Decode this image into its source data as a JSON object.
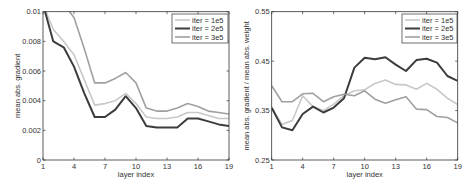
{
  "chart_data": [
    {
      "type": "line",
      "title": "",
      "xlabel": "layer index",
      "ylabel": "mean abs. gradient",
      "xlim": [
        1,
        19
      ],
      "ylim": [
        0,
        0.01
      ],
      "xticks": [
        "1",
        "4",
        "7",
        "10",
        "13",
        "16",
        "19"
      ],
      "yticks": [
        "0",
        "0.002",
        "0.004",
        "0.006",
        "0.008",
        "0.01"
      ],
      "grid": false,
      "legend_position": "upper right",
      "x": [
        1,
        2,
        3,
        4,
        5,
        6,
        7,
        8,
        9,
        10,
        11,
        12,
        13,
        14,
        15,
        16,
        17,
        18,
        19
      ],
      "series": [
        {
          "name": "iter = 1e5",
          "color": "#c8c8c8",
          "width": 1.6,
          "values": [
            0.0105,
            0.0088,
            0.008,
            0.0071,
            0.0054,
            0.0037,
            0.0038,
            0.004,
            0.0045,
            0.0038,
            0.0029,
            0.0028,
            0.0028,
            0.0029,
            0.0032,
            0.0032,
            0.003,
            0.0028,
            0.0028
          ]
        },
        {
          "name": "iter = 2e5",
          "color": "#3c3c3c",
          "width": 2.0,
          "values": [
            0.0105,
            0.008,
            0.0076,
            0.0063,
            0.0045,
            0.0029,
            0.0029,
            0.0034,
            0.0043,
            0.0035,
            0.0023,
            0.0022,
            0.0022,
            0.0022,
            0.0028,
            0.0028,
            0.0026,
            0.0024,
            0.0023
          ]
        },
        {
          "name": "iter = 3e5",
          "color": "#a0a0a0",
          "width": 1.6,
          "values": [
            0.0105,
            0.0105,
            0.0105,
            0.0096,
            0.0075,
            0.0052,
            0.0052,
            0.0055,
            0.0059,
            0.0052,
            0.0035,
            0.0033,
            0.0033,
            0.0035,
            0.0038,
            0.0036,
            0.0033,
            0.0032,
            0.0031
          ]
        }
      ]
    },
    {
      "type": "line",
      "title": "",
      "xlabel": "layer index",
      "ylabel": "mean abs. gradient / mean abs. weight",
      "xlim": [
        1,
        19
      ],
      "ylim": [
        0.25,
        0.55
      ],
      "xticks": [
        "1",
        "4",
        "7",
        "10",
        "13",
        "16",
        "19"
      ],
      "yticks": [
        "0.25",
        "0.35",
        "0.45",
        "0.55"
      ],
      "grid": false,
      "legend_position": "upper right",
      "x": [
        1,
        2,
        3,
        4,
        5,
        6,
        7,
        8,
        9,
        10,
        11,
        12,
        13,
        14,
        15,
        16,
        17,
        18,
        19
      ],
      "series": [
        {
          "name": "iter = 1e5",
          "color": "#c8c8c8",
          "width": 1.6,
          "values": [
            0.356,
            0.322,
            0.33,
            0.38,
            0.358,
            0.35,
            0.363,
            0.38,
            0.39,
            0.392,
            0.405,
            0.412,
            0.403,
            0.402,
            0.393,
            0.405,
            0.393,
            0.375,
            0.362
          ]
        },
        {
          "name": "iter = 2e5",
          "color": "#3c3c3c",
          "width": 2.0,
          "values": [
            0.356,
            0.316,
            0.31,
            0.343,
            0.358,
            0.346,
            0.356,
            0.375,
            0.437,
            0.457,
            0.454,
            0.458,
            0.443,
            0.43,
            0.452,
            0.455,
            0.447,
            0.42,
            0.41
          ]
        },
        {
          "name": "iter = 3e5",
          "color": "#a0a0a0",
          "width": 1.6,
          "values": [
            0.4,
            0.368,
            0.368,
            0.384,
            0.385,
            0.368,
            0.378,
            0.383,
            0.38,
            0.39,
            0.373,
            0.365,
            0.372,
            0.378,
            0.353,
            0.352,
            0.338,
            0.336,
            0.325
          ]
        }
      ]
    }
  ],
  "layout": {
    "panels": [
      {
        "left": 43,
        "right": 229,
        "top": 11.7,
        "bottom": 160,
        "legend": {
          "x": 172,
          "y": 14,
          "w": 56,
          "h": 29
        },
        "ylabel_x": 20
      },
      {
        "left": 271.7,
        "right": 457.7,
        "top": 11.7,
        "bottom": 160,
        "legend": {
          "x": 402,
          "y": 14,
          "w": 55,
          "h": 29
        },
        "ylabel_x": 249
      }
    ]
  }
}
